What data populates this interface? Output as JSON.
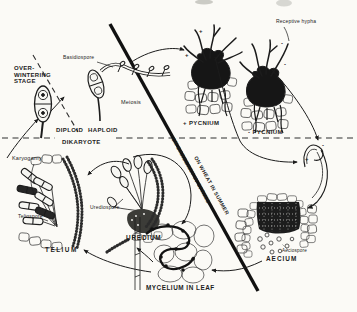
{
  "colors": {
    "ink": "#1c1c1c",
    "paper": "#fbfaf6"
  },
  "labels": {
    "over_wintering": "OVER-\nWINTERING\nSTAGE",
    "basidiospore": "Basidiospore",
    "meiosis": "Meiosis",
    "diploid": "DIPLOID",
    "haploid": "HAPLOID",
    "dikaryote": "DIKARYOTE",
    "karyogamy": "Karyogamy",
    "teliospore": "Teliospore",
    "telium": "TELIUM",
    "urediospore": "Urediospore",
    "uredium": "UREDIUM",
    "mycelium_in_leaf": "MYCELIUM IN LEAF",
    "aecium": "AECIUM",
    "aeciospore": "Aeciospore",
    "plus_pycnium": "+ PYCNIUM",
    "minus_pycnium": "- PYCNIUM",
    "receptive_hypha": "Receptive hypha",
    "season_barberry": "ON BARBERRY IN SPRING",
    "season_wheat": "ON WHEAT IN SUMMER",
    "plus_sign": "+",
    "minus_sign": "-"
  }
}
